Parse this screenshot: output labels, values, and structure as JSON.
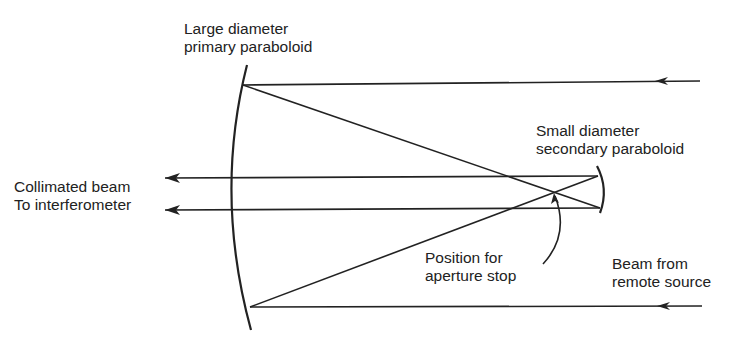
{
  "labels": {
    "primary": [
      "Large diameter",
      "primary paraboloid"
    ],
    "secondary": [
      "Small diameter",
      "secondary paraboloid"
    ],
    "collimated": [
      "Collimated beam",
      "To interferometer"
    ],
    "aperture": [
      "Position for",
      "aperture stop"
    ],
    "source": [
      "Beam from",
      "remote source"
    ]
  },
  "colors": {
    "line": "#222222",
    "background": "#ffffff"
  }
}
